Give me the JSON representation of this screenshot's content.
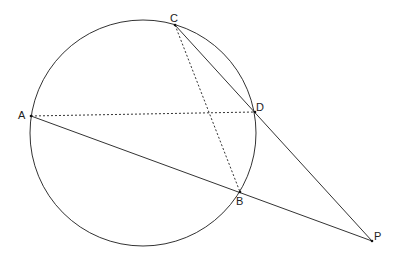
{
  "diagram": {
    "type": "circle-secant-geometry",
    "circle": {
      "cx": 143,
      "cy": 133,
      "r": 113
    },
    "points": {
      "A": {
        "label": "A",
        "x": 31,
        "y": 116
      },
      "B": {
        "label": "B",
        "x": 240,
        "y": 192
      },
      "C": {
        "label": "C",
        "x": 175,
        "y": 25
      },
      "D": {
        "label": "D",
        "x": 255,
        "y": 112
      },
      "P": {
        "label": "P",
        "x": 372,
        "y": 241
      }
    },
    "solid_segments": [
      "A-P",
      "C-P"
    ],
    "dashed_segments": [
      "A-D",
      "C-B"
    ],
    "stroke_color": "#333333"
  }
}
